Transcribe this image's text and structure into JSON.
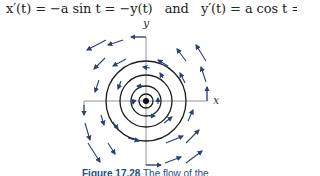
{
  "equation": {
    "left": "x′(t) = −a sin t = −y(t)",
    "connector": "and",
    "right": "y′(t) = a cos t = x(t)."
  },
  "figure": {
    "axis_labels": {
      "x": "x",
      "y": "y"
    },
    "circle_radii_px": [
      7,
      15,
      26,
      40
    ],
    "caption_number": "Figure 17.28",
    "caption_text": "The flow of the"
  }
}
